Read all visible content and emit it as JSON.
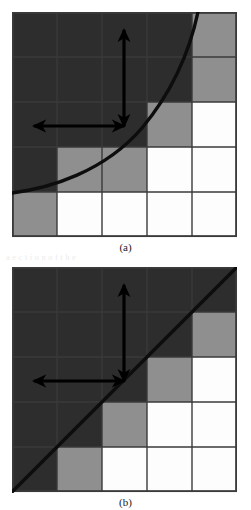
{
  "figure": {
    "colors": {
      "dark_fill": "#2d2d2d",
      "gray_fill": "#8f8f8f",
      "white_fill": "#fdfdfd",
      "grid_line": "#3a3a3a",
      "curve": "#0d0d0d",
      "arrow": "#000000",
      "background": "#ffffff"
    },
    "grid": {
      "rows": 5,
      "cols": 5,
      "cell_px": 45
    },
    "legend_meaning": {
      "dark": "interior cell (fully inside region)",
      "gray": "boundary cell (intersected by the curve)",
      "white": "exterior cell (fully outside region)"
    }
  },
  "panels": [
    {
      "id": "panel-a",
      "caption": "(a)",
      "curve_type": "convex-quadratic",
      "curve_label": "monotone convex boundary curve",
      "cells": [
        [
          "dark",
          "dark",
          "dark",
          "dark",
          "gray"
        ],
        [
          "dark",
          "dark",
          "dark",
          "dark",
          "gray"
        ],
        [
          "dark",
          "dark",
          "dark",
          "gray",
          "white"
        ],
        [
          "dark",
          "gray",
          "gray",
          "white",
          "white"
        ],
        [
          "gray",
          "white",
          "white",
          "white",
          "white"
        ]
      ],
      "arrows": {
        "vertical": {
          "name": "vertical-double-arrow",
          "x": 112,
          "y_top": 18,
          "y_bottom": 114
        },
        "horizontal": {
          "name": "horizontal-double-arrow",
          "y": 114,
          "x_left": 22,
          "x_right": 112
        }
      }
    },
    {
      "id": "panel-b",
      "caption": "(b)",
      "curve_type": "linear-diagonal",
      "curve_label": "straight diagonal boundary line y = x",
      "cells": [
        [
          "dark",
          "dark",
          "dark",
          "dark",
          "dark"
        ],
        [
          "dark",
          "dark",
          "dark",
          "dark",
          "gray"
        ],
        [
          "dark",
          "dark",
          "dark",
          "gray",
          "white"
        ],
        [
          "dark",
          "dark",
          "gray",
          "white",
          "white"
        ],
        [
          "dark",
          "gray",
          "white",
          "white",
          "white"
        ]
      ],
      "arrows": {
        "vertical": {
          "name": "vertical-double-arrow",
          "x": 112,
          "y_top": 18,
          "y_bottom": 114
        },
        "horizontal": {
          "name": "horizontal-double-arrow",
          "y": 114,
          "x_left": 22,
          "x_right": 112
        }
      }
    }
  ],
  "background_text": {
    "line1": "a   e  c  t  i   o  n   o f   t  h  e",
    "line2": "r  e   s   u   l  t    o  f    t  h  e",
    "line3": "i  n   t  e  r  v  a  l   s   e  t",
    "line4": "h  e   c  o  m  p  o  n  e  n  t",
    "line5": "v  a   r   i   a  b  l  e   d  a   t  a"
  }
}
